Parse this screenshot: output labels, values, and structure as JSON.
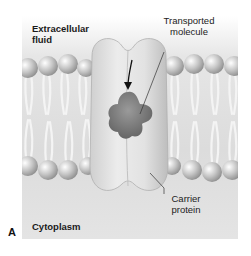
{
  "figure": {
    "panel_letter": "A",
    "labels": {
      "extracellular": [
        "Extracellular",
        "fluid"
      ],
      "transported_molecule": [
        "Transported",
        "molecule"
      ],
      "carrier_protein": [
        "Carrier",
        "protein"
      ],
      "cytoplasm": "Cytoplasm"
    },
    "colors": {
      "background_top": "#ffffff",
      "background": "#dcdcdc",
      "protein": "#d8d8d8",
      "molecule": "#7a7a7a",
      "phospholipid_head": "#bdbdbd",
      "tails": "#eeeeee",
      "arrow": "#111111"
    }
  }
}
